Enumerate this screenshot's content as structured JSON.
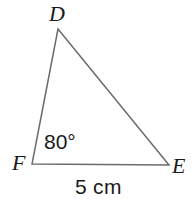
{
  "figure": {
    "type": "triangle-diagram",
    "background_color": "#ffffff",
    "stroke_color": "#6b6b6b",
    "text_color": "#1a1a1a",
    "width": 194,
    "height": 203
  },
  "labels": {
    "vertex_d": "D",
    "vertex_e": "E",
    "vertex_f": "F",
    "angle_f": "80°",
    "side_fe": "5 cm"
  },
  "geometry": {
    "vertices": {
      "D": {
        "x": 58,
        "y": 29
      },
      "F": {
        "x": 32,
        "y": 164
      },
      "E": {
        "x": 169,
        "y": 165
      }
    },
    "path": "M 58 29 L 32 164 L 169 165 Z",
    "stroke_width": 1.5
  }
}
